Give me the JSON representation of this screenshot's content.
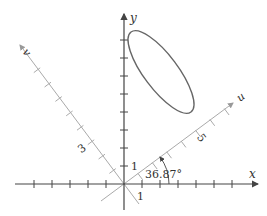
{
  "diagram": {
    "axes": {
      "x": {
        "label": "x"
      },
      "y": {
        "label": "y"
      },
      "u": {
        "label": "u",
        "tick_label": "5"
      },
      "v": {
        "label": "v",
        "tick_label": "3"
      }
    },
    "labels": {
      "x_unit": "1",
      "y_unit": "1",
      "angle": "36.87°"
    },
    "colors": {
      "axis": "#444444",
      "rotated_axis": "#aaaaaa",
      "ellipse": "#666666",
      "text": "#333333"
    }
  }
}
